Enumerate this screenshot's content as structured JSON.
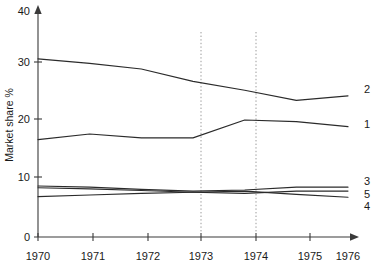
{
  "chart_data": {
    "type": "line",
    "title": "",
    "subtitle": "",
    "xlabel": "",
    "ylabel": "Market share %",
    "x": [
      1970,
      1971,
      1972,
      1973,
      1974,
      1975,
      1976
    ],
    "xtick_labels": [
      "1970",
      "1971",
      "1972",
      "1973",
      "1974",
      "1975",
      "1976"
    ],
    "ytick_labels": [
      "0",
      "10",
      "20",
      "30",
      "40"
    ],
    "yticks": [
      0,
      10,
      20,
      30,
      40
    ],
    "xlim": [
      1970,
      1976
    ],
    "ylim": [
      0,
      40
    ],
    "grid": false,
    "legend_position": "right-end-labels",
    "annotations": [
      {
        "type": "vertical-dotted-line",
        "x": 1973,
        "label": "1973"
      },
      {
        "type": "vertical-dotted-line",
        "x": 1974,
        "label": "1974"
      }
    ],
    "series": [
      {
        "name": "2",
        "label": "2",
        "values": [
          31.8,
          31.0,
          30.0,
          27.8,
          26.2,
          24.4,
          25.2
        ]
      },
      {
        "name": "1",
        "label": "1",
        "values": [
          17.4,
          18.4,
          17.7,
          17.7,
          20.9,
          20.6,
          19.7
        ]
      },
      {
        "name": "3",
        "label": "3",
        "values": [
          9.1,
          8.9,
          8.5,
          8.2,
          8.4,
          8.9,
          8.9
        ]
      },
      {
        "name": "5",
        "label": "5",
        "values": [
          8.8,
          8.6,
          8.3,
          8.0,
          7.8,
          8.2,
          8.2
        ]
      },
      {
        "name": "4",
        "label": "4",
        "values": [
          7.2,
          7.5,
          7.8,
          8.0,
          8.2,
          7.6,
          7.1
        ]
      }
    ]
  },
  "axis": {
    "y_title": "Market share %"
  },
  "series_labels": {
    "s2": "2",
    "s1": "1",
    "s3": "3",
    "s5": "5",
    "s4": "4"
  },
  "xticks": {
    "t0": "1970",
    "t1": "1971",
    "t2": "1972",
    "t3": "1973",
    "t4": "1974",
    "t5": "1975",
    "t6": "1976"
  },
  "yticks": {
    "t0": "0",
    "t10": "10",
    "t20": "20",
    "t30": "30",
    "t40": "40"
  }
}
